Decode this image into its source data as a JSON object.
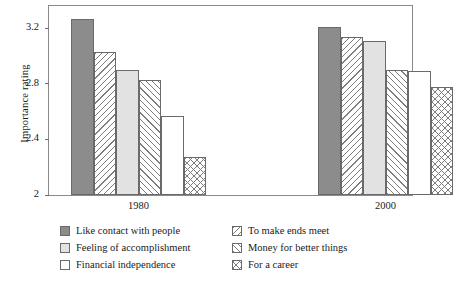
{
  "chart_data": {
    "type": "bar",
    "title": "",
    "xlabel": "",
    "ylabel": "Importance rating",
    "categories": [
      "1980",
      "2000"
    ],
    "ylim": [
      2,
      3.36
    ],
    "yticks": [
      2,
      2.4,
      2.8,
      3.2
    ],
    "ytick_labels": [
      "2",
      "2.4",
      "2.8",
      "3.2"
    ],
    "grid": false,
    "legend_position": "below-plot",
    "series": [
      {
        "name": "Like contact with people",
        "pattern": "solid-gray",
        "values": [
          3.27,
          3.21
        ]
      },
      {
        "name": "To make ends meet",
        "pattern": "backslash-hatch",
        "values": [
          3.03,
          3.14
        ]
      },
      {
        "name": "Feeling of accomplishment",
        "pattern": "light-gray",
        "values": [
          2.9,
          3.11
        ]
      },
      {
        "name": "Money for better things",
        "pattern": "forwardslash-hatch",
        "values": [
          2.83,
          2.9
        ]
      },
      {
        "name": "Financial independence",
        "pattern": "white",
        "values": [
          2.57,
          2.89
        ]
      },
      {
        "name": "For a career",
        "pattern": "crosshatch",
        "values": [
          2.27,
          2.78
        ]
      }
    ]
  },
  "legend": {
    "left_column": [
      {
        "label": "Like contact with people",
        "swatch": "solid-gray-swatch"
      },
      {
        "label": "Feeling of accomplishment",
        "swatch": "light-gray-swatch"
      },
      {
        "label": "Financial independence",
        "swatch": "white-swatch"
      }
    ],
    "right_column": [
      {
        "label": "To make ends meet",
        "swatch": "backslash-hatch-swatch"
      },
      {
        "label": "Money for better things",
        "swatch": "forwardslash-hatch-swatch"
      },
      {
        "label": "For a career",
        "swatch": "crosshatch-swatch"
      }
    ]
  },
  "colors": {
    "solid_gray": "#8c8c8c",
    "light_gray": "#e2e2e2",
    "white": "#ffffff",
    "hatch_line": "#7d7d7d",
    "outline": "#6a6a6a",
    "frame": "#8a8a8a",
    "text": "#1a1a1a"
  }
}
